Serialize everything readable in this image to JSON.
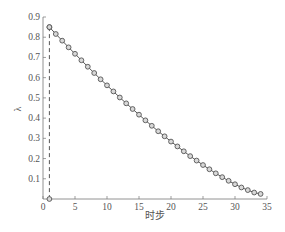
{
  "chart_data": {
    "type": "line",
    "title": "",
    "xlabel": "时步",
    "ylabel": "λ",
    "xlim": [
      0,
      35
    ],
    "ylim": [
      0,
      0.9
    ],
    "xticks": [
      0,
      5,
      10,
      15,
      20,
      25,
      30,
      35
    ],
    "xtick_labels": [
      "0",
      "5",
      "10",
      "15",
      "20",
      "25",
      "30",
      "35"
    ],
    "yticks": [
      0.1,
      0.2,
      0.3,
      0.4,
      0.5,
      0.6,
      0.7,
      0.8,
      0.9
    ],
    "ytick_labels": [
      "0.1",
      "0.2",
      "0.3",
      "0.4",
      "0.5",
      "0.6",
      "0.7",
      "0.8",
      "0.9"
    ],
    "grid": false,
    "legend": null,
    "series": [
      {
        "name": "λ",
        "style": "solid line with circle markers",
        "x": [
          1,
          2,
          3,
          4,
          5,
          6,
          7,
          8,
          9,
          10,
          11,
          12,
          13,
          14,
          15,
          16,
          17,
          18,
          19,
          20,
          21,
          22,
          23,
          24,
          25,
          26,
          27,
          28,
          29,
          30,
          31,
          32,
          33,
          34
        ],
        "values": [
          0.85,
          0.816,
          0.783,
          0.75,
          0.718,
          0.686,
          0.654,
          0.623,
          0.592,
          0.562,
          0.532,
          0.502,
          0.473,
          0.445,
          0.417,
          0.389,
          0.362,
          0.335,
          0.31,
          0.284,
          0.26,
          0.236,
          0.212,
          0.19,
          0.168,
          0.147,
          0.127,
          0.108,
          0.09,
          0.073,
          0.057,
          0.044,
          0.032,
          0.025
        ]
      },
      {
        "name": "initial drop",
        "style": "dashed vertical line with circle markers",
        "x": [
          1,
          1
        ],
        "values": [
          0.85,
          0.0
        ]
      }
    ],
    "colors": {
      "line": "#444444",
      "marker": "#555555",
      "axis": "#777777",
      "text": "#555555"
    }
  }
}
